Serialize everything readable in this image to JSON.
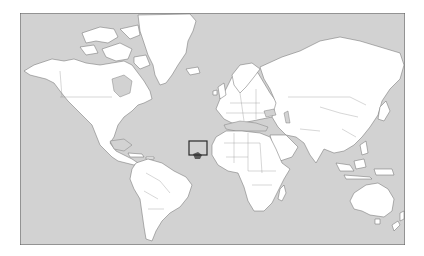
{
  "map": {
    "projection": "mercator",
    "ocean_color": "#d2d2d2",
    "land_color": "#ffffff",
    "border_color": "#6a6a6a",
    "frame_color": "#555555",
    "highlight": {
      "region": "Senegal / The Gambia",
      "box_color": "#2a2a2a",
      "fill_color": "#5a5a5a"
    },
    "regions": [
      "North America",
      "Greenland",
      "South America",
      "Europe",
      "Africa",
      "Asia",
      "Australia",
      "Antarctica-edge",
      "Madagascar",
      "New Zealand"
    ]
  }
}
